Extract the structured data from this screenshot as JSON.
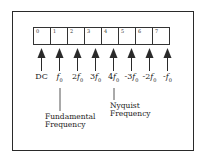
{
  "diagram": {
    "cells": [
      {
        "index": "0",
        "label": "DC",
        "coef": "",
        "sym": ""
      },
      {
        "index": "1",
        "label": "",
        "coef": "",
        "sym": "f"
      },
      {
        "index": "2",
        "label": "",
        "coef": "2",
        "sym": "f"
      },
      {
        "index": "3",
        "label": "",
        "coef": "3",
        "sym": "f"
      },
      {
        "index": "4",
        "label": "",
        "coef": "4",
        "sym": "f"
      },
      {
        "index": "5",
        "label": "",
        "coef": "-3",
        "sym": "f"
      },
      {
        "index": "6",
        "label": "",
        "coef": "-2",
        "sym": "f"
      },
      {
        "index": "7",
        "label": "",
        "coef": "-",
        "sym": "f"
      }
    ],
    "subscript": "0",
    "annotations": {
      "fundamental_line1": "Fundamental",
      "fundamental_line2": "Frequency",
      "nyquist_line1": "Nyquist",
      "nyquist_line2": "Frequency"
    },
    "colors": {
      "stroke": "#2a2a2a",
      "background": "#ffffff"
    }
  }
}
